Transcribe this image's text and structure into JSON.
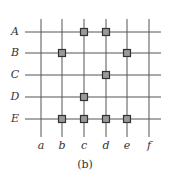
{
  "diagram": {
    "rows": [
      "A",
      "B",
      "C",
      "D",
      "E"
    ],
    "columns": [
      "a",
      "b",
      "c",
      "d",
      "e",
      "f"
    ],
    "row_y": [
      32,
      53,
      75,
      97,
      119
    ],
    "col_x": [
      41,
      62,
      84,
      106,
      127,
      149
    ],
    "nodes": [
      {
        "row": "A",
        "col": "c"
      },
      {
        "row": "A",
        "col": "d"
      },
      {
        "row": "B",
        "col": "b"
      },
      {
        "row": "B",
        "col": "e"
      },
      {
        "row": "C",
        "col": "d"
      },
      {
        "row": "D",
        "col": "c"
      },
      {
        "row": "E",
        "col": "b"
      },
      {
        "row": "E",
        "col": "c"
      },
      {
        "row": "E",
        "col": "d"
      },
      {
        "row": "E",
        "col": "e"
      }
    ],
    "caption": "(b)",
    "colors": {
      "line": "#555555",
      "node_fill": "#999999",
      "node_border": "#333333"
    }
  },
  "labels": {
    "row_0": "A",
    "row_1": "B",
    "row_2": "C",
    "row_3": "D",
    "row_4": "E",
    "col_0": "a",
    "col_1": "b",
    "col_2": "c",
    "col_3": "d",
    "col_4": "e",
    "col_5": "f"
  }
}
